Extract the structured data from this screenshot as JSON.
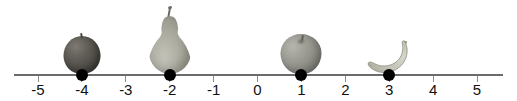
{
  "figure": {
    "type": "number-line",
    "background_color": "#ffffff",
    "axis_color": "#6b6b6b",
    "point_color": "#000000",
    "label_color": "#111111"
  },
  "number_line": {
    "min": -5,
    "max": 5,
    "tick_step": 1,
    "tick_labels": [
      "-5",
      "-4",
      "-3",
      "-2",
      "-1",
      "0",
      "1",
      "2",
      "3",
      "4",
      "5"
    ],
    "tick_values": [
      -5,
      -4,
      -3,
      -2,
      -1,
      0,
      1,
      2,
      3,
      4,
      5
    ],
    "plotted_points": [
      -4,
      -2,
      1,
      3
    ],
    "point_labels": [
      "-4",
      "-2",
      "1",
      "3"
    ]
  },
  "objects": [
    {
      "name": "plum",
      "icon": "plum-icon",
      "value": -4,
      "label": "-4",
      "color": "#4e4b46"
    },
    {
      "name": "pear",
      "icon": "pear-icon",
      "value": -2,
      "label": "-2",
      "color": "#a8a79c"
    },
    {
      "name": "apple",
      "icon": "apple-icon",
      "value": 1,
      "label": "1",
      "color": "#8d8d86"
    },
    {
      "name": "banana",
      "icon": "banana-icon",
      "value": 3,
      "label": "3",
      "color": "#c5c5b8"
    }
  ],
  "chart_data": {
    "type": "scatter",
    "title": "",
    "xlabel": "",
    "ylabel": "",
    "xlim": [
      -5,
      5
    ],
    "grid": false,
    "legend": "none",
    "categories": [
      "plum",
      "pear",
      "apple",
      "banana"
    ],
    "x": [
      -4,
      -2,
      1,
      3
    ],
    "values": [
      -4,
      -2,
      1,
      3
    ],
    "tick_labels": [
      "-5",
      "-4",
      "-3",
      "-2",
      "-1",
      "0",
      "1",
      "2",
      "3",
      "4",
      "5"
    ]
  }
}
